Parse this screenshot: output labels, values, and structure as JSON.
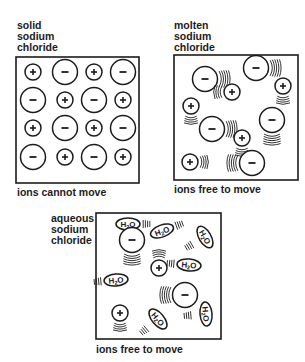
{
  "panels": {
    "solid": {
      "title_lines": [
        "solid",
        "sodium",
        "chloride"
      ],
      "caption": "ions cannot move",
      "box": {
        "x": 16,
        "y": 57,
        "w": 123,
        "h": 126
      },
      "ions": [
        {
          "charge": "+",
          "x": 33,
          "y": 72
        },
        {
          "charge": "-",
          "x": 65,
          "y": 72
        },
        {
          "charge": "+",
          "x": 94,
          "y": 72
        },
        {
          "charge": "-",
          "x": 123,
          "y": 72
        },
        {
          "charge": "-",
          "x": 33,
          "y": 100
        },
        {
          "charge": "+",
          "x": 65,
          "y": 100
        },
        {
          "charge": "-",
          "x": 94,
          "y": 100
        },
        {
          "charge": "+",
          "x": 123,
          "y": 100
        },
        {
          "charge": "+",
          "x": 33,
          "y": 128
        },
        {
          "charge": "-",
          "x": 65,
          "y": 128
        },
        {
          "charge": "+",
          "x": 94,
          "y": 128
        },
        {
          "charge": "-",
          "x": 123,
          "y": 128
        },
        {
          "charge": "-",
          "x": 33,
          "y": 157
        },
        {
          "charge": "+",
          "x": 65,
          "y": 157
        },
        {
          "charge": "-",
          "x": 94,
          "y": 157
        },
        {
          "charge": "+",
          "x": 123,
          "y": 157
        }
      ]
    },
    "molten": {
      "title_lines": [
        "molten",
        "sodium",
        "chloride"
      ],
      "caption": "ions free to move",
      "box": {
        "x": 174,
        "y": 55,
        "w": 124,
        "h": 125
      },
      "ions": [
        {
          "charge": "-",
          "x": 205,
          "y": 79,
          "motion": "right"
        },
        {
          "charge": "-",
          "x": 256,
          "y": 68,
          "motion": "right"
        },
        {
          "charge": "+",
          "x": 283,
          "y": 86,
          "motion": "down"
        },
        {
          "charge": "+",
          "x": 232,
          "y": 92,
          "motion": "left"
        },
        {
          "charge": "+",
          "x": 191,
          "y": 106,
          "motion": "down"
        },
        {
          "charge": "-",
          "x": 212,
          "y": 129,
          "motion": "right"
        },
        {
          "charge": "-",
          "x": 272,
          "y": 120,
          "motion": "down"
        },
        {
          "charge": "+",
          "x": 242,
          "y": 138,
          "motion": "down"
        },
        {
          "charge": "+",
          "x": 190,
          "y": 162,
          "motion": "right"
        },
        {
          "charge": "-",
          "x": 252,
          "y": 163,
          "motion": "left"
        }
      ]
    },
    "aqueous": {
      "title_lines": [
        "aqueous",
        "sodium",
        "chloride"
      ],
      "caption": "ions free to move",
      "box": {
        "x": 96,
        "y": 213,
        "w": 125,
        "h": 126
      },
      "molecule_label": "H2O",
      "ions": [
        {
          "charge": "-",
          "x": 132,
          "y": 240,
          "motion": "down"
        },
        {
          "charge": "+",
          "x": 159,
          "y": 268,
          "motion": "up"
        },
        {
          "charge": "-",
          "x": 185,
          "y": 295,
          "motion": "left"
        },
        {
          "charge": "+",
          "x": 120,
          "y": 313,
          "motion": "down"
        }
      ],
      "water": [
        {
          "x": 128,
          "y": 224,
          "angle": 0,
          "motion": "right"
        },
        {
          "x": 162,
          "y": 231,
          "angle": -20,
          "motion": "right"
        },
        {
          "x": 205,
          "y": 237,
          "angle": 60,
          "motion": "down"
        },
        {
          "x": 189,
          "y": 265,
          "angle": 5,
          "motion": "left"
        },
        {
          "x": 116,
          "y": 280,
          "angle": -5,
          "motion": "left"
        },
        {
          "x": 158,
          "y": 319,
          "angle": 50,
          "motion": "down"
        },
        {
          "x": 206,
          "y": 314,
          "angle": 85,
          "motion": "down"
        }
      ]
    }
  },
  "colors": {
    "ink": "#1c1c1c",
    "background": "#ffffff"
  }
}
